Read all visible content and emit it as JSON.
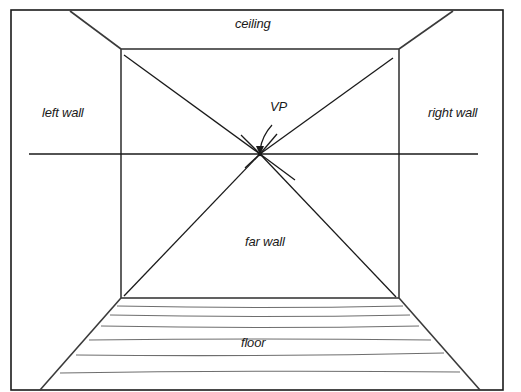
{
  "diagram": {
    "type": "one-point perspective room",
    "labels": {
      "ceiling": "ceiling",
      "left_wall": "left wall",
      "right_wall": "right wall",
      "vanishing_point": "VP",
      "far_wall": "far wall",
      "floor": "floor"
    },
    "colors": {
      "line": "#1a1a1a",
      "floor_lines": "#6e6e6e",
      "background": "#ffffff"
    }
  }
}
